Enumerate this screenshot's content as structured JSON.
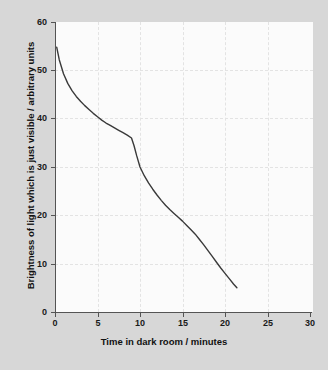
{
  "chart_data": {
    "type": "line",
    "title": "",
    "xlabel": "Time in dark room / minutes",
    "ylabel": "Brightness of light which is just visible / arbitrary units",
    "xlim": [
      0,
      30
    ],
    "ylim": [
      0,
      60
    ],
    "xticks": [
      "0",
      "5",
      "10",
      "15",
      "20",
      "25",
      "30"
    ],
    "yticks": [
      "0",
      "10",
      "20",
      "30",
      "40",
      "50",
      "60"
    ],
    "grid": true,
    "legend": "none",
    "series": [
      {
        "name": "Dark adaptation curve",
        "color": "#3a3a3a",
        "x": [
          0.2,
          0.5,
          1.0,
          1.5,
          2.0,
          2.5,
          3.0,
          3.5,
          4.0,
          4.5,
          5.0,
          5.5,
          6.0,
          6.5,
          7.0,
          7.5,
          8.0,
          8.5,
          9.0,
          9.3,
          9.6,
          10.0,
          10.5,
          11.0,
          11.5,
          12.0,
          12.5,
          13.0,
          13.5,
          14.0,
          14.5,
          15.0,
          15.5,
          16.0,
          16.5,
          17.0,
          17.5,
          18.0,
          18.5,
          19.0,
          19.5,
          20.0,
          20.5,
          21.0,
          21.4
        ],
        "y": [
          54.8,
          52.2,
          49.3,
          47.3,
          45.8,
          44.6,
          43.6,
          42.7,
          41.9,
          41.1,
          40.4,
          39.7,
          39.1,
          38.6,
          38.1,
          37.6,
          37.1,
          36.6,
          36.0,
          34.4,
          32.4,
          30.0,
          28.2,
          26.7,
          25.4,
          24.2,
          23.1,
          22.1,
          21.2,
          20.4,
          19.6,
          18.8,
          17.9,
          17.0,
          16.1,
          15.0,
          13.9,
          12.7,
          11.5,
          10.3,
          9.1,
          8.0,
          6.9,
          5.8,
          5.0
        ]
      }
    ],
    "annotations": [
      {
        "name": "rod-cone-break",
        "x": 9.0,
        "y": 36.0
      }
    ]
  },
  "axes": {
    "x_title": "Time in dark room / minutes",
    "y_title": "Brightness of light which is just visible / arbitrary units",
    "x_tick_labels": [
      "0",
      "5",
      "10",
      "15",
      "20",
      "25",
      "30"
    ],
    "y_tick_labels": [
      "0",
      "10",
      "20",
      "30",
      "40",
      "50",
      "60"
    ]
  },
  "colors": {
    "background": "#d7d7d7",
    "plot_background": "#fbfbfb",
    "axis": "#545454",
    "grid": "#e3e3e3",
    "curve": "#3a3a3a",
    "text": "#111111"
  }
}
